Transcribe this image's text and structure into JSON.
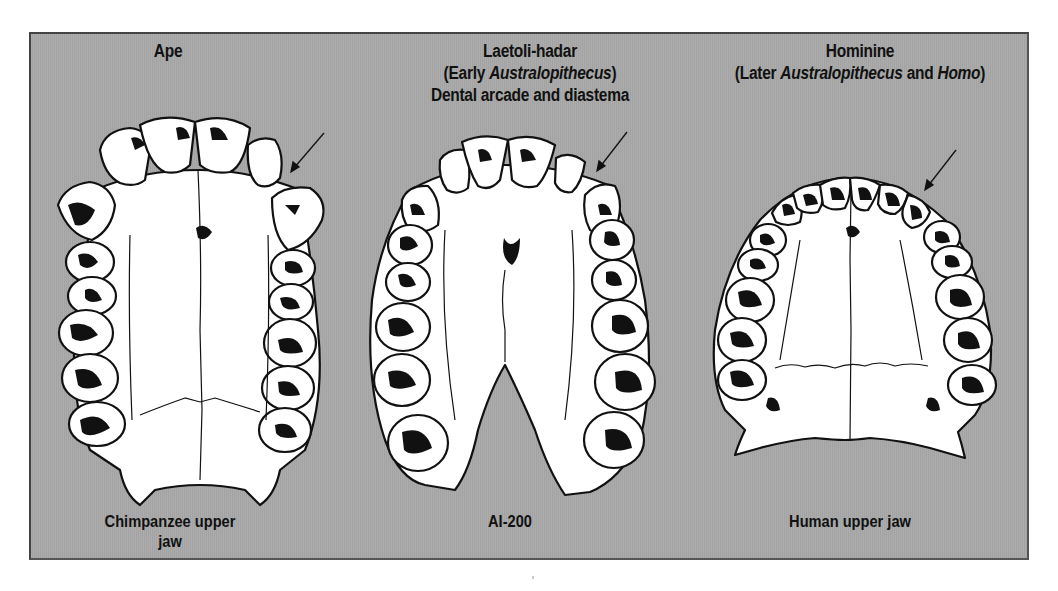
{
  "figure": {
    "background_color": "#a8a8a8",
    "border_color": "#444444",
    "line_color": "#111111",
    "bone_color": "#ffffff"
  },
  "panels": [
    {
      "id": "ape",
      "title": "Ape",
      "caption": "Chimpanzee upper jaw",
      "arrow_target": "diastema"
    },
    {
      "id": "laetoli-hadar",
      "title": "Laetoli-hadar",
      "subtitle_prefix": "(Early ",
      "subtitle_italic": "Australopithecus",
      "subtitle_suffix": ")",
      "subtitle2": "Dental arcade and diastema",
      "caption": "AI-200",
      "arrow_target": "diastema"
    },
    {
      "id": "hominine",
      "title": "Hominine",
      "subtitle_prefix": "(Later ",
      "subtitle_italic": "Australopithecus",
      "subtitle_middle": " and ",
      "subtitle_italic2": "Homo",
      "subtitle_suffix": ")",
      "caption": "Human upper jaw",
      "arrow_target": "canine-gap-closed"
    }
  ]
}
